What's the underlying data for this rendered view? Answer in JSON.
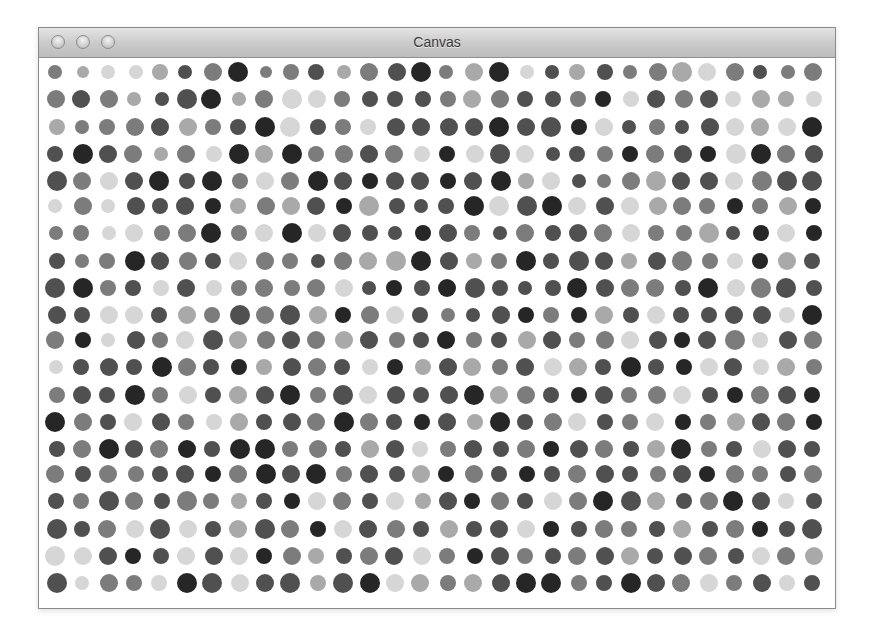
{
  "window": {
    "title": "Canvas",
    "buttons": [
      {
        "name": "close-button",
        "state": "inactive"
      },
      {
        "name": "minimize-button",
        "state": "inactive"
      },
      {
        "name": "zoom-button",
        "state": "inactive"
      }
    ]
  },
  "canvas": {
    "description": "Grid of randomly shaded and sized grayscale circles",
    "columns": 30,
    "rows": 20,
    "origin_x": 17,
    "origin_y": 15,
    "spacing_x": 26.1,
    "spacing_y": 26.8,
    "shades": [
      "#d6d6d6",
      "#a9a9a9",
      "#7c7c7c",
      "#505050",
      "#262626"
    ],
    "grid": [
      "27 16 07 07 18 37 29 410 26 28 38 17 29 39 410 27 19 410 07 37 18 38 27 29 110 09 29 37 27 29",
      "29 39 29 17 37 310 410 17 29 010 09 28 38 38 38 28 19 29 38 38 28 48 08 39 29 39 08 19 18 08",
      "18 27 28 29 39 19 28 38 410 010 38 28 08 39 39 39 39 410 39 310 48 09 37 28 37 39 09 19 09 410",
      "38 410 39 29 17 29 08 410 19 410 28 29 39 29 08 48 09 310 09 37 38 28 48 29 39 48 010 410 29 39",
      "310 29 09 39 410 38 410 28 09 29 410 39 48 39 39 48 39 410 18 09 37 27 29 110 39 39 09 210 310 310",
      "07 29 07 39 38 39 48 18 29 19 39 48 110 38 37 38 410 010 310 410 09 39 09 19 29 28 48 28 19 48",
      "27 28 07 09 28 29 410 28 09 410 09 39 38 37 48 39 28 37 29 38 39 29 09 28 28 110 37 48 09 48",
      "38 27 28 410 39 29 38 09 29 28 37 29 19 110 410 39 18 28 410 38 310 39 18 39 210 28 08 48 19 38",
      "310 410 28 38 08 39 08 28 29 28 29 09 37 48 38 49 310 38 37 38 410 39 29 29 38 410 09 210 310 38",
      "39 38 09 09 38 19 28 310 29 310 19 48 29 09 38 27 37 39 48 28 48 19 38 09 38 38 39 39 08 410",
      "29 48 07 39 28 09 310 19 29 39 29 19 39 28 38 49 28 38 19 39 28 29 09 39 48 39 210 08 39 29",
      "07 38 39 38 410 29 38 48 18 39 29 38 08 48 18 39 19 28 39 09 19 38 410 38 48 09 39 08 19 28",
      "28 39 38 410 28 09 38 19 39 410 28 310 09 39 38 39 410 19 29 38 48 39 28 29 09 38 48 29 39 48",
      "410 29 38 09 39 28 08 19 38 39 29 410 29 38 48 39 18 410 38 29 09 38 28 09 48 28 19 39 29 48",
      "38 29 410 39 29 49 38 410 410 28 29 38 19 39 08 28 39 38 29 48 39 29 38 19 410 28 38 09 39 38",
      "29 38 29 28 38 39 48 29 410 39 410 28 39 38 19 48 29 38 48 38 29 39 38 28 39 48 29 28 38 29",
      "38 28 310 29 38 210 28 18 38 48 09 29 38 09 18 39 48 29 38 09 29 410 310 19 38 29 410 39 08 38",
      "310 38 29 09 310 09 38 19 310 29 48 09 39 29 38 19 38 39 09 48 38 29 28 38 19 38 29 48 38 310",
      "010 09 39 48 38 09 39 09 48 29 18 38 29 39 09 28 48 39 28 38 29 39 19 38 39 29 38 09 29 19",
      "310 07 29 28 08 410 310 09 39 310 18 310 410 09 19 28 19 39 410 410 28 38 410 39 29 09 28 39 08 38"
    ],
    "background": "#ffffff"
  }
}
